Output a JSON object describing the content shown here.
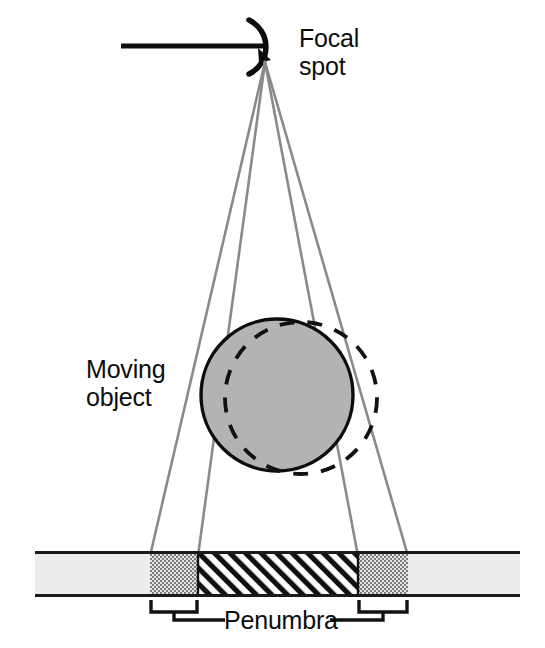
{
  "figure": {
    "background_color": "#ffffff"
  },
  "labels": {
    "focal_spot": "Focal\nspot",
    "moving_object": "Moving\nobject",
    "penumbra": "Penumbra"
  },
  "colors": {
    "ray": "#8a8a8a",
    "object_fill": "#b3b3b3",
    "object_stroke": "#0d0d0d",
    "dashed_outline": "#111111",
    "bar_fill": "#ededed",
    "bar_border": "#1a1a1a",
    "penumbra_fill": "#b4b4b4",
    "umbra_stroke": "#111111",
    "text": "#0d0d0d"
  },
  "geometry": {
    "focal_point": {
      "x": 265,
      "y": 62
    },
    "anode_line": {
      "x1": 121,
      "y1": 46,
      "x2": 268,
      "y2": 46
    },
    "anode_arc_radius": 28,
    "rays": [
      {
        "name": "outer-left",
        "x_end": 150
      },
      {
        "name": "inner-left",
        "x_end": 198
      },
      {
        "name": "inner-right",
        "x_end": 358
      },
      {
        "name": "outer-right",
        "x_end": 408
      }
    ],
    "object_solid": {
      "cx": 277,
      "cy": 395,
      "r": 76
    },
    "object_dashed": {
      "cx": 301,
      "cy": 398,
      "r": 76
    },
    "detector_bar": {
      "x": 35,
      "y": 552,
      "width": 485,
      "height": 44
    },
    "umbra": {
      "x1": 198,
      "x2": 358
    },
    "penumbra_left": {
      "x1": 150,
      "x2": 198
    },
    "penumbra_right": {
      "x1": 358,
      "x2": 408
    },
    "bracket_left": {
      "x1": 150,
      "x2": 198,
      "y": 604
    },
    "bracket_right": {
      "x1": 358,
      "x2": 408,
      "y": 604
    },
    "leader_y": 618
  }
}
